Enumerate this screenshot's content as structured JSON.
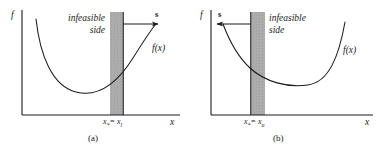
{
  "figure": {
    "background_color": "#ffffff",
    "line_color": "#1a1a1a",
    "band_fill_color": "#a8a8a8",
    "band_edge_color": "#555555"
  },
  "panels": [
    {
      "id": "a",
      "caption": "(a)",
      "y_axis_label": "f",
      "x_axis_label": "x",
      "curve_label": "f(x)",
      "vector_label": "s",
      "infeasible_line1": "infeasible",
      "infeasible_line2": "side",
      "infeasible_align": "right",
      "tick_label_main": "x",
      "tick_label_sub1": "*",
      "tick_label_eq": "= x",
      "tick_label_sub2": "l",
      "arrow_direction": "right",
      "minimum_side": "left-of-band"
    },
    {
      "id": "b",
      "caption": "(b)",
      "y_axis_label": "f",
      "x_axis_label": "x",
      "curve_label": "f(x)",
      "vector_label": "s",
      "infeasible_line1": "infeasible",
      "infeasible_line2": "side",
      "infeasible_align": "left",
      "tick_label_main": "x",
      "tick_label_sub1": "*",
      "tick_label_eq": "= x",
      "tick_label_sub2": "u",
      "arrow_direction": "left",
      "minimum_side": "right-of-band"
    }
  ]
}
